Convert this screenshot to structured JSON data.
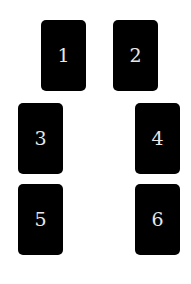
{
  "cards": [
    {
      "label": "1"
    },
    {
      "label": "2"
    },
    {
      "label": "3"
    },
    {
      "label": "4"
    },
    {
      "label": "5"
    },
    {
      "label": "6"
    }
  ],
  "colors": {
    "background": "#ffffff",
    "card": "#000000",
    "label": "#e8e8e8"
  }
}
